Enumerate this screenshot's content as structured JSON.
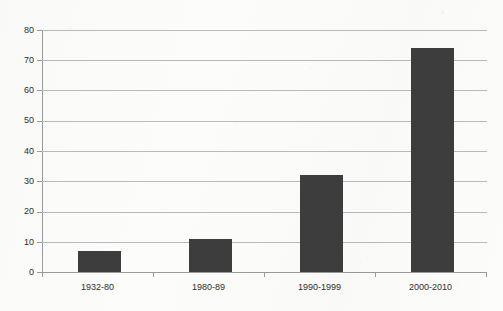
{
  "chart_data": {
    "type": "bar",
    "title": "",
    "subtitle": "",
    "xlabel": "",
    "ylabel": "",
    "categories": [
      "1932-80",
      "1980-89",
      "1990-1999",
      "2000-2010"
    ],
    "values": [
      7,
      11,
      32,
      74
    ],
    "series": [
      {
        "name": "",
        "values": [
          7,
          11,
          32,
          74
        ]
      }
    ],
    "ylim": [
      0,
      80
    ],
    "ytick_labels": [
      "0",
      "10",
      "20",
      "30",
      "40",
      "50",
      "60",
      "70",
      "80"
    ],
    "ytick_values": [
      0,
      10,
      20,
      30,
      40,
      50,
      60,
      70,
      80
    ],
    "grid": true,
    "grid_axis": "y",
    "legend": false,
    "legend_position": "none",
    "annotations": [],
    "colors": {
      "bar_fill": "#3d3d3d",
      "gridline": "#b9b9b9",
      "axis_line": "#9a9a9a",
      "tick_label": "#2e2e2e",
      "background": "#fcfcfb"
    }
  }
}
